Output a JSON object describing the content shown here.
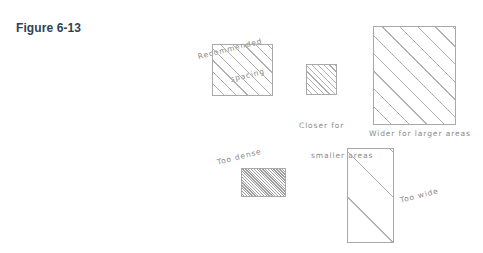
{
  "figure": {
    "label": "Figure 6-13",
    "label_color": "#2f4254"
  },
  "canvas": {
    "background": "#ffffff",
    "ink_color": "#a9a9a9",
    "text_color": "#8a8a8a"
  },
  "diagram": {
    "type": "hand-drawn hatching spacing reference",
    "annotations": {
      "recommended_spacing_line1": "Recommended",
      "recommended_spacing_line2": "spacing",
      "closer_line1": "Closer for",
      "closer_line2": "smaller areas",
      "wider": "Wider for larger areas",
      "too_dense": "Too dense",
      "too_wide": "Too wide"
    },
    "samples": [
      {
        "name": "recommended-spacing-square",
        "hatch_spacing": "normal",
        "caption": "Recommended spacing",
        "width": 61,
        "height": 52
      },
      {
        "name": "closer-small-square",
        "hatch_spacing": "close",
        "caption": "Closer for smaller areas",
        "width": 31,
        "height": 31
      },
      {
        "name": "wider-large-rectangle",
        "hatch_spacing": "wide",
        "caption": "Wider for larger areas",
        "width": 83,
        "height": 99
      },
      {
        "name": "too-dense-rectangle",
        "hatch_spacing": "dense",
        "caption": "Too dense",
        "width": 45,
        "height": 29
      },
      {
        "name": "too-wide-rectangle",
        "hatch_spacing": "too-wide",
        "caption": "Too wide",
        "width": 47,
        "height": 95
      }
    ]
  }
}
